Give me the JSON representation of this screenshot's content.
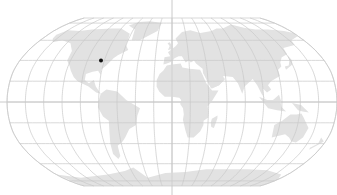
{
  "map": {
    "projection": "Robinson",
    "center_x": 172,
    "equator_y": 102,
    "half_width": 165,
    "half_height": 84,
    "graticule_step_deg": 20,
    "colors": {
      "background": "#ffffff",
      "graticule": "#c8c8c8",
      "land": "#e2e2e2",
      "marker": "#111111"
    },
    "markers": [
      {
        "name": "location-marker",
        "lon": -84,
        "lat": 40
      }
    ]
  }
}
